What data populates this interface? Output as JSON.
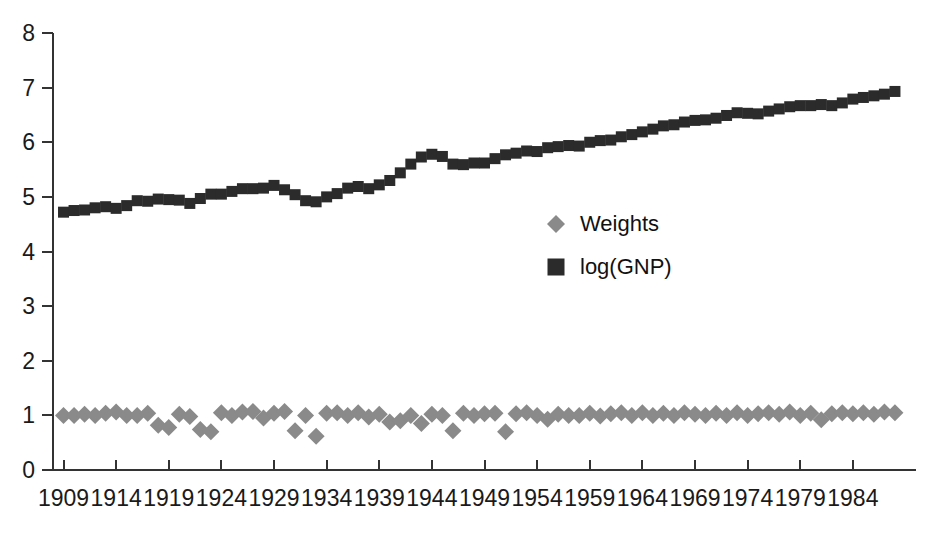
{
  "chart_data": {
    "type": "scatter",
    "title": "",
    "xlabel": "",
    "ylabel": "",
    "xlim": [
      1908,
      1990
    ],
    "ylim": [
      0,
      8
    ],
    "grid": false,
    "legend_position": "center-right",
    "x_tick_labels": [
      "1909",
      "1914",
      "1919",
      "1924",
      "1929",
      "1934",
      "1939",
      "1944",
      "1949",
      "1954",
      "1959",
      "1964",
      "1969",
      "1974",
      "1979",
      "1984"
    ],
    "x_tick_values": [
      1909,
      1914,
      1919,
      1924,
      1929,
      1934,
      1939,
      1944,
      1949,
      1954,
      1959,
      1964,
      1969,
      1974,
      1979,
      1984
    ],
    "y_tick_labels": [
      "0",
      "1",
      "2",
      "3",
      "4",
      "5",
      "6",
      "7",
      "8"
    ],
    "y_tick_values": [
      0,
      1,
      2,
      3,
      4,
      5,
      6,
      7,
      8
    ],
    "x": [
      1909,
      1910,
      1911,
      1912,
      1913,
      1914,
      1915,
      1916,
      1917,
      1918,
      1919,
      1920,
      1921,
      1922,
      1923,
      1924,
      1925,
      1926,
      1927,
      1928,
      1929,
      1930,
      1931,
      1932,
      1933,
      1934,
      1935,
      1936,
      1937,
      1938,
      1939,
      1940,
      1941,
      1942,
      1943,
      1944,
      1945,
      1946,
      1947,
      1948,
      1949,
      1950,
      1951,
      1952,
      1953,
      1954,
      1955,
      1956,
      1957,
      1958,
      1959,
      1960,
      1961,
      1962,
      1963,
      1964,
      1965,
      1966,
      1967,
      1968,
      1969,
      1970,
      1971,
      1972,
      1973,
      1974,
      1975,
      1976,
      1977,
      1978,
      1979,
      1980,
      1981,
      1982,
      1983,
      1984,
      1985,
      1986,
      1987,
      1988
    ],
    "series": [
      {
        "name": "log(GNP)",
        "marker": "square",
        "color": "#2b2b2b",
        "values": [
          4.72,
          4.75,
          4.76,
          4.8,
          4.82,
          4.79,
          4.84,
          4.93,
          4.92,
          4.96,
          4.95,
          4.94,
          4.88,
          4.97,
          5.05,
          5.05,
          5.1,
          5.15,
          5.15,
          5.16,
          5.21,
          5.13,
          5.04,
          4.93,
          4.91,
          5.0,
          5.06,
          5.16,
          5.19,
          5.15,
          5.22,
          5.3,
          5.44,
          5.6,
          5.73,
          5.78,
          5.74,
          5.6,
          5.59,
          5.62,
          5.62,
          5.7,
          5.77,
          5.8,
          5.84,
          5.83,
          5.9,
          5.92,
          5.94,
          5.93,
          6.0,
          6.03,
          6.04,
          6.1,
          6.14,
          6.19,
          6.24,
          6.3,
          6.32,
          6.37,
          6.4,
          6.41,
          6.44,
          6.49,
          6.54,
          6.53,
          6.52,
          6.57,
          6.61,
          6.65,
          6.67,
          6.67,
          6.69,
          6.67,
          6.72,
          6.79,
          6.82,
          6.85,
          6.88,
          6.93
        ]
      },
      {
        "name": "Weights",
        "marker": "diamond",
        "color": "#8a8a8a",
        "values": [
          1.0,
          1.0,
          1.02,
          1.0,
          1.04,
          1.06,
          1.0,
          1.0,
          1.04,
          0.82,
          0.78,
          1.02,
          0.98,
          0.74,
          0.7,
          1.05,
          1.0,
          1.06,
          1.07,
          0.95,
          1.04,
          1.07,
          0.72,
          1.0,
          0.62,
          1.04,
          1.05,
          1.0,
          1.05,
          0.97,
          1.02,
          0.88,
          0.9,
          1.0,
          0.85,
          1.02,
          1.0,
          0.72,
          1.04,
          1.0,
          1.03,
          1.04,
          0.7,
          1.03,
          1.05,
          1.0,
          0.93,
          1.02,
          1.0,
          1.0,
          1.04,
          0.99,
          1.03,
          1.05,
          1.0,
          1.05,
          1.0,
          1.04,
          1.0,
          1.05,
          1.02,
          1.0,
          1.04,
          1.0,
          1.05,
          1.0,
          1.03,
          1.05,
          1.02,
          1.06,
          1.0,
          1.04,
          0.92,
          1.03,
          1.05,
          1.03,
          1.05,
          1.02,
          1.06,
          1.05
        ]
      }
    ]
  },
  "legend": {
    "items": [
      {
        "label": "Weights",
        "marker": "diamond",
        "color": "#8a8a8a"
      },
      {
        "label": "log(GNP)",
        "marker": "square",
        "color": "#2b2b2b"
      }
    ]
  },
  "axis": {
    "color": "#333333"
  }
}
